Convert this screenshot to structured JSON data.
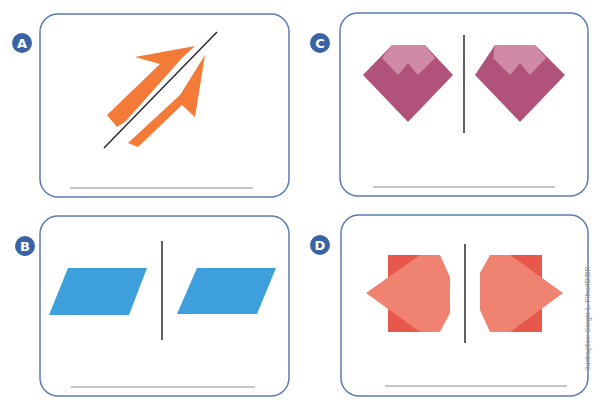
{
  "colors": {
    "card_border": "#5b7bb4",
    "badge": "#3a63a6",
    "axis": "#2b2b2b",
    "answer_line": "#8d8d8d",
    "arrow": "#f47a38",
    "gem_dark": "#b0527a",
    "gem_light": "#cf8aa6",
    "parallelogram": "#3da0dc",
    "square": "#e8584a",
    "octagon": "#f08272"
  },
  "cards": [
    {
      "id": "A",
      "label": "A",
      "figure": "two arrows separated by a diagonal line"
    },
    {
      "id": "B",
      "label": "B",
      "figure": "two parallelograms separated by a vertical line"
    },
    {
      "id": "C",
      "label": "C",
      "figure": "two gems separated by a vertical line"
    },
    {
      "id": "D",
      "label": "D",
      "figure": "two square-and-octagon shapes separated by a vertical line"
    }
  ],
  "credit": "Ilustrações: Sergio L. Filho/ID/BR"
}
